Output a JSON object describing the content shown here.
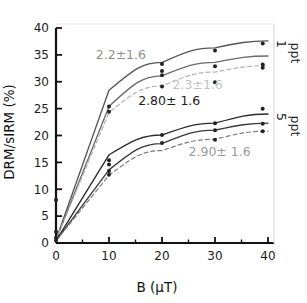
{
  "chart_data": {
    "type": "line",
    "title": "",
    "xlabel": "B (μT)",
    "ylabel": "DRM/sIRM (%)",
    "xlim": [
      0,
      40
    ],
    "ylim": [
      0,
      40
    ],
    "xticks": [
      0,
      10,
      20,
      30,
      40
    ],
    "yticks": [
      0,
      5,
      10,
      15,
      20,
      25,
      30,
      35,
      40
    ],
    "xtick_labels": [
      "0",
      "10",
      "20",
      "30",
      "40"
    ],
    "ytick_labels": [
      "0",
      "5",
      "10",
      "15",
      "20",
      "25",
      "30",
      "35",
      "40"
    ],
    "grid": false,
    "legend_position": "right-inside",
    "x": [
      0,
      10,
      20,
      30,
      40
    ],
    "series": [
      {
        "name": "1 ppt upper",
        "group": "1 ppt",
        "style": "solid",
        "color": "#555555",
        "values": [
          0.6,
          28.4,
          33.6,
          36.3,
          37.6
        ]
      },
      {
        "name": "1 ppt middle",
        "group": "1 ppt",
        "style": "solid",
        "color": "#6a6a6a",
        "values": [
          0.6,
          25.4,
          31.1,
          33.6,
          34.8
        ]
      },
      {
        "name": "1 ppt lower",
        "group": "1 ppt",
        "style": "dashed",
        "color": "#b3b3b3",
        "values": [
          0.6,
          24.3,
          29.2,
          31.8,
          33.0
        ]
      },
      {
        "name": "5 ppt upper",
        "group": "5 ppt",
        "style": "solid",
        "color": "#2a2a2a",
        "values": [
          0.4,
          16.4,
          20.1,
          22.3,
          24.0
        ]
      },
      {
        "name": "5 ppt middle",
        "group": "5 ppt",
        "style": "solid",
        "color": "#3a3a3a",
        "values": [
          0.4,
          13.6,
          18.5,
          21.0,
          22.3
        ]
      },
      {
        "name": "5 ppt lower",
        "group": "5 ppt",
        "style": "dashed",
        "color": "#7d7d7d",
        "values": [
          0.4,
          12.6,
          17.2,
          19.3,
          20.8
        ]
      }
    ],
    "scatter_points": [
      {
        "x": 0.0,
        "y": 0.5
      },
      {
        "x": 0.0,
        "y": 1.0
      },
      {
        "x": 0.0,
        "y": 2.1
      },
      {
        "x": 0.0,
        "y": 8.0
      },
      {
        "x": 10,
        "y": 25.4
      },
      {
        "x": 10,
        "y": 24.4
      },
      {
        "x": 10,
        "y": 15.4
      },
      {
        "x": 10,
        "y": 14.6
      },
      {
        "x": 10,
        "y": 13.4
      },
      {
        "x": 10,
        "y": 12.7
      },
      {
        "x": 20,
        "y": 33.3
      },
      {
        "x": 20,
        "y": 32.0
      },
      {
        "x": 20,
        "y": 31.2
      },
      {
        "x": 20,
        "y": 29.1
      },
      {
        "x": 20,
        "y": 20.1
      },
      {
        "x": 20,
        "y": 18.6
      },
      {
        "x": 30,
        "y": 35.8
      },
      {
        "x": 30,
        "y": 32.9
      },
      {
        "x": 30,
        "y": 29.9
      },
      {
        "x": 30,
        "y": 22.3
      },
      {
        "x": 30,
        "y": 21.0
      },
      {
        "x": 30,
        "y": 19.2
      },
      {
        "x": 39,
        "y": 37.1
      },
      {
        "x": 39,
        "y": 33.2
      },
      {
        "x": 39,
        "y": 32.6
      },
      {
        "x": 39,
        "y": 25.0
      },
      {
        "x": 39,
        "y": 22.2
      },
      {
        "x": 39,
        "y": 20.8
      }
    ],
    "annotations": [
      {
        "id": "annot-2-2",
        "text": "2.2±1.6",
        "x": 7.5,
        "y": 34.2,
        "color": "#8f8f8f"
      },
      {
        "id": "annot-2-3",
        "text": "2.3±1.6",
        "x": 22.0,
        "y": 28.6,
        "color": "#c2c2c2"
      },
      {
        "id": "annot-2-80",
        "text": "2.80± 1.6",
        "x": 15.5,
        "y": 25.6,
        "color": "#1c1c1c"
      },
      {
        "id": "annot-2-90",
        "text": "2.90± 1.6",
        "x": 25.0,
        "y": 16.2,
        "color": "#9a9a9a"
      }
    ],
    "legend_entries": [
      {
        "id": "legend-1ppt",
        "line1": "1",
        "line2": "ppt"
      },
      {
        "id": "legend-5ppt",
        "line1": "5",
        "line2": "ppt"
      }
    ]
  }
}
